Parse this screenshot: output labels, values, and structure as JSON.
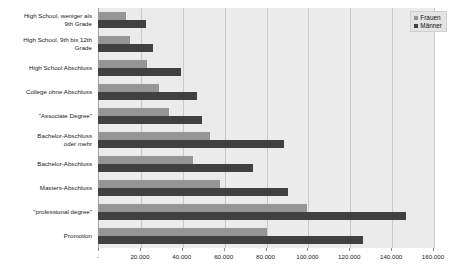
{
  "chart_data": {
    "type": "bar",
    "orientation": "horizontal",
    "title": "",
    "subtitle": "",
    "xlabel": "",
    "ylabel": "",
    "xlim": [
      0,
      160000
    ],
    "xticks": [
      0,
      20000,
      40000,
      60000,
      80000,
      100000,
      120000,
      140000,
      160000
    ],
    "xticklabels": [
      "-",
      "20.000",
      "40.000",
      "60.000",
      "80.000",
      "100.000",
      "120.000",
      "140.000",
      "160.000"
    ],
    "grid": true,
    "legend_position": "top-right",
    "categories": [
      "High School, weniger als 9th Grade",
      "High School, 9th bis 12th Grade",
      "High School Abschluss",
      "College ohne Abschluss",
      "\"Associate Degree\"",
      "Bachelor-Abschluss oder mehr",
      "Bachelor-Abschluss",
      "Masters-Abschluss",
      "\"professional degree\"",
      "Promotion"
    ],
    "category_lines": [
      [
        "High School, weniger als",
        "9th Grade"
      ],
      [
        "High School, 9th bis 12th",
        "Grade"
      ],
      [
        "High School Abschluss"
      ],
      [
        "College ohne Abschluss"
      ],
      [
        "\"Associate Degree\""
      ],
      [
        "Bachelor-Abschluss",
        "oder mehr"
      ],
      [
        "Bachelor-Abschluss"
      ],
      [
        "Masters-Abschluss"
      ],
      [
        "\"professional degree\""
      ],
      [
        "Promotion"
      ]
    ],
    "series": [
      {
        "name": "Frauen",
        "color": "#969696",
        "values": [
          13600,
          15200,
          23500,
          29300,
          33800,
          53700,
          45600,
          58400,
          100000,
          80800
        ]
      },
      {
        "name": "Männer",
        "color": "#404040",
        "values": [
          22700,
          26400,
          39500,
          47500,
          49800,
          88800,
          73900,
          90700,
          147200,
          126400
        ]
      }
    ]
  },
  "legend": {
    "entries": [
      {
        "label": "Frauen"
      },
      {
        "label": "Männer"
      }
    ]
  },
  "colors": {
    "frauen": "#969696",
    "maenner": "#404040",
    "plot_background": "#ebebeb",
    "gridline": "#c9c9c9",
    "page_background": "#ffffff"
  }
}
